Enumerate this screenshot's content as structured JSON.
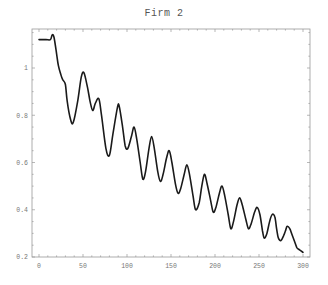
{
  "chart_data": {
    "type": "line",
    "title": "Firm 2",
    "xlabel": "",
    "ylabel": "",
    "xlim": [
      -8,
      307
    ],
    "ylim": [
      0.2,
      1.17
    ],
    "grid": false,
    "legend": null,
    "x_ticks": [
      0,
      50,
      100,
      150,
      200,
      250,
      300
    ],
    "x_tick_labels": [
      "0",
      "50",
      "100",
      "150",
      "200",
      "250",
      "300"
    ],
    "y_ticks": [
      0.2,
      0.4,
      0.6,
      0.8,
      1.0
    ],
    "y_tick_labels": [
      "0.2",
      "0.4",
      "0.6",
      "0.8",
      "1"
    ],
    "series": [
      {
        "name": "Firm 2",
        "x": [
          0,
          8,
          13,
          15,
          17,
          20,
          22,
          25,
          27,
          30,
          32,
          36,
          39,
          44,
          48,
          51,
          55,
          58,
          61,
          64,
          68,
          71,
          76,
          80,
          84,
          89,
          91,
          95,
          98,
          101,
          105,
          108,
          111,
          115,
          118,
          121,
          125,
          128,
          131,
          135,
          138,
          141,
          145,
          148,
          151,
          155,
          158,
          161,
          165,
          168,
          171,
          175,
          178,
          182,
          185,
          188,
          191,
          195,
          198,
          201,
          205,
          208,
          211,
          215,
          218,
          221,
          225,
          228,
          231,
          235,
          238,
          241,
          245,
          248,
          251,
          254,
          256,
          259,
          262,
          265,
          268,
          270,
          272,
          275,
          278,
          280,
          282,
          285,
          287,
          290,
          293,
          296,
          300
        ],
        "y": [
          1.12,
          1.12,
          1.12,
          1.14,
          1.13,
          1.06,
          1.01,
          0.97,
          0.95,
          0.93,
          0.86,
          0.78,
          0.77,
          0.86,
          0.96,
          0.98,
          0.92,
          0.86,
          0.82,
          0.85,
          0.87,
          0.8,
          0.66,
          0.63,
          0.72,
          0.83,
          0.84,
          0.75,
          0.67,
          0.66,
          0.71,
          0.75,
          0.7,
          0.6,
          0.53,
          0.56,
          0.66,
          0.71,
          0.66,
          0.56,
          0.52,
          0.55,
          0.62,
          0.65,
          0.6,
          0.51,
          0.47,
          0.49,
          0.55,
          0.59,
          0.55,
          0.46,
          0.4,
          0.43,
          0.5,
          0.55,
          0.51,
          0.44,
          0.39,
          0.41,
          0.47,
          0.5,
          0.46,
          0.38,
          0.32,
          0.35,
          0.42,
          0.45,
          0.42,
          0.36,
          0.32,
          0.34,
          0.39,
          0.41,
          0.38,
          0.31,
          0.28,
          0.3,
          0.35,
          0.38,
          0.37,
          0.32,
          0.28,
          0.27,
          0.29,
          0.31,
          0.33,
          0.32,
          0.3,
          0.27,
          0.24,
          0.23,
          0.22
        ]
      }
    ]
  },
  "chart": {
    "title": "Firm 2",
    "line_color": "#1a1a1a",
    "frame_color": "#9a9a9a"
  }
}
